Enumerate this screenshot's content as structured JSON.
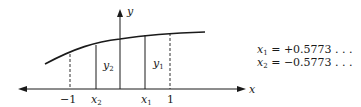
{
  "diagram": {
    "axis_labels": {
      "x": "x",
      "y": "y"
    },
    "ticks": [
      {
        "label": "−1",
        "kind": "dashed"
      },
      {
        "label": "x",
        "sub": "2",
        "kind": "solid"
      },
      {
        "label": "x",
        "sub": "1",
        "kind": "solid"
      },
      {
        "label": "1",
        "kind": "dashed"
      }
    ],
    "ordinates": [
      {
        "label": "y",
        "sub": "2"
      },
      {
        "label": "y",
        "sub": "1"
      }
    ],
    "equations": [
      {
        "var": "x",
        "sub": "1",
        "value": "= +0.5773 . . ."
      },
      {
        "var": "x",
        "sub": "2",
        "value": "= −0.5773 . . ."
      }
    ]
  }
}
